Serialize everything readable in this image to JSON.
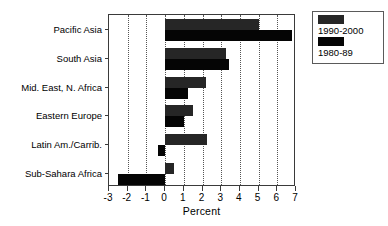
{
  "chart_data": {
    "type": "bar",
    "orientation": "horizontal",
    "title": "",
    "xlabel": "Percent",
    "ylabel": "",
    "xlim": [
      -3,
      7
    ],
    "xticks": [
      -3,
      -2,
      -1,
      0,
      1,
      2,
      3,
      4,
      5,
      6,
      7
    ],
    "xtick_labels": [
      "-3",
      "-2",
      "-1",
      "0",
      "1",
      "2",
      "3",
      "4",
      "5",
      "6",
      "7"
    ],
    "grid": true,
    "grid_axis": "x",
    "grid_style": "dotted",
    "legend_position": "top-right",
    "categories": [
      "Pacific Asia",
      "South Asia",
      "Mid. East, N. Africa",
      "Eastern Europe",
      "Latin Am./Carrib.",
      "Sub-Sahara Africa"
    ],
    "series": [
      {
        "name": "1990-2000",
        "color": "#262626",
        "values": [
          5.0,
          3.25,
          2.2,
          1.5,
          2.25,
          0.5
        ]
      },
      {
        "name": "1980-89",
        "color": "#050505",
        "values": [
          6.8,
          3.4,
          1.2,
          1.0,
          -0.4,
          -2.5
        ]
      }
    ]
  },
  "legend": {
    "entries": [
      {
        "label": "1990-2000",
        "color": "#262626"
      },
      {
        "label": "1980-89",
        "color": "#050505"
      }
    ]
  }
}
